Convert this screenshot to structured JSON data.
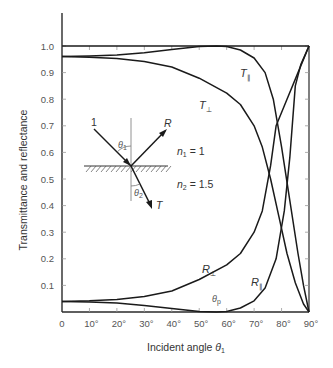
{
  "chart_data": {
    "type": "line",
    "title": "",
    "xlabel": "Incident angle θ1",
    "ylabel": "Transmittance and reflectance",
    "xlim": [
      0,
      90
    ],
    "ylim": [
      0,
      1.0
    ],
    "x_ticks": [
      "0",
      "10°",
      "20°",
      "30°",
      "40°",
      "50°",
      "60°",
      "70°",
      "80°",
      "90°"
    ],
    "y_ticks": [
      "0.1",
      "0.2",
      "0.3",
      "0.4",
      "0.5",
      "0.6",
      "0.7",
      "0.8",
      "0.9",
      "1.0"
    ],
    "grid": false,
    "legend": "inline curve labels",
    "series": [
      {
        "name": "T∥",
        "x": [
          0,
          10,
          20,
          30,
          40,
          50,
          56.3,
          60,
          65,
          70,
          74,
          77,
          80,
          83,
          86,
          88,
          90
        ],
        "values": [
          0.96,
          0.962,
          0.966,
          0.975,
          0.987,
          0.998,
          1.0,
          0.998,
          0.985,
          0.955,
          0.9,
          0.8,
          0.62,
          0.42,
          0.22,
          0.1,
          0.0
        ]
      },
      {
        "name": "T⊥",
        "x": [
          0,
          10,
          20,
          30,
          40,
          50,
          60,
          65,
          70,
          73,
          76,
          79,
          82,
          85,
          88,
          90
        ],
        "values": [
          0.96,
          0.958,
          0.953,
          0.942,
          0.921,
          0.879,
          0.823,
          0.78,
          0.7,
          0.62,
          0.5,
          0.36,
          0.22,
          0.11,
          0.03,
          0.0
        ]
      },
      {
        "name": "R⊥",
        "x": [
          0,
          10,
          20,
          30,
          40,
          50,
          60,
          65,
          70,
          73,
          76,
          78,
          82,
          86,
          90
        ],
        "values": [
          0.04,
          0.042,
          0.047,
          0.058,
          0.079,
          0.122,
          0.177,
          0.22,
          0.3,
          0.38,
          0.55,
          0.7,
          0.8,
          0.9,
          1.0
        ]
      },
      {
        "name": "R∥",
        "x": [
          0,
          10,
          20,
          30,
          40,
          50,
          56.3,
          60,
          65,
          70,
          74,
          78,
          81,
          83,
          85,
          87,
          90
        ],
        "values": [
          0.04,
          0.038,
          0.034,
          0.025,
          0.013,
          0.002,
          0.0,
          0.002,
          0.015,
          0.042,
          0.09,
          0.2,
          0.38,
          0.58,
          0.85,
          0.93,
          1.0
        ]
      },
      {
        "name": "R⊥ + T⊥ = 1 (reference)",
        "x": [
          0,
          90
        ],
        "values": [
          1.0,
          1.0
        ]
      }
    ],
    "annotations": [
      {
        "text": "T∥",
        "x": 73,
        "y": 0.86
      },
      {
        "text": "T⊥",
        "x": 55,
        "y": 0.78
      },
      {
        "text": "R⊥",
        "x": 63,
        "y": 0.17
      },
      {
        "text": "R∥",
        "x": 78,
        "y": 0.1
      },
      {
        "text": "θp",
        "x": 56.3,
        "y": 0.02
      },
      {
        "text": "n1 = 1",
        "x": 60,
        "y": 0.58
      },
      {
        "text": "n2 = 1.5",
        "x": 60,
        "y": 0.48
      }
    ],
    "inset": {
      "incident_label": "1",
      "reflected_label": "R",
      "transmitted_label": "T",
      "incident_angle_label": "θ1",
      "refracted_angle_label": "θ2",
      "medium1": "n1 = 1",
      "medium2": "n2 = 1.5"
    }
  },
  "labels": {
    "ylabel": "Transmittance and reflectance",
    "xlabel_main": "Incident angle ",
    "xlabel_theta": "θ",
    "xlabel_sub": "1",
    "T_par": "T",
    "T_perp": "T",
    "R_par": "R",
    "R_perp": "R",
    "par_sub": "∥",
    "perp_sub": "⊥",
    "theta_p": "θ",
    "theta_p_sub": "p",
    "inset_1": "1",
    "inset_R": "R",
    "inset_T": "T",
    "inset_theta": "θ",
    "inset_theta1_sub": "1",
    "inset_theta2_sub": "2",
    "n1": "n",
    "n1_sub": "1",
    "n1_val": " = 1",
    "n2": "n",
    "n2_sub": "2",
    "n2_val": " = 1.5"
  },
  "colors": {
    "curve": "#1a1a1a",
    "axis": "#2a2a2a",
    "tick_label": "#555555"
  }
}
